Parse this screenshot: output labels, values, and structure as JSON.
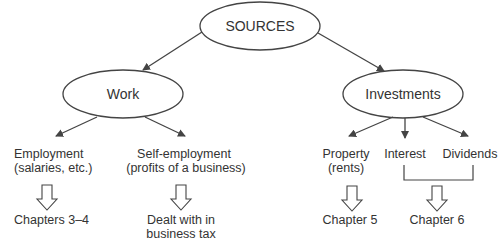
{
  "diagram": {
    "colors": {
      "stroke": "#444444",
      "text": "#333333",
      "background": "#ffffff"
    },
    "root": {
      "label": "SOURCES"
    },
    "categories": [
      {
        "id": "work",
        "label": "Work"
      },
      {
        "id": "investments",
        "label": "Investments"
      }
    ],
    "leaves": {
      "employment": {
        "line1": "Employment",
        "line2": "(salaries, etc.)"
      },
      "self_employment": {
        "line1": "Self-employment",
        "line2": "(profits of a business)"
      },
      "property": {
        "line1": "Property",
        "line2": "(rents)"
      },
      "interest": {
        "line1": "Interest"
      },
      "dividends": {
        "line1": "Dividends"
      }
    },
    "outcomes": {
      "employment": {
        "line1": "Chapters 3–4"
      },
      "self_employment": {
        "line1": "Dealt with in",
        "line2": "business tax"
      },
      "property": {
        "line1": "Chapter 5"
      },
      "interest_dividends": {
        "line1": "Chapter 6"
      }
    },
    "edges": [
      {
        "from": "SOURCES",
        "to": "Work"
      },
      {
        "from": "SOURCES",
        "to": "Investments"
      },
      {
        "from": "Work",
        "to": "Employment"
      },
      {
        "from": "Work",
        "to": "Self-employment"
      },
      {
        "from": "Investments",
        "to": "Property"
      },
      {
        "from": "Investments",
        "to": "Interest"
      },
      {
        "from": "Investments",
        "to": "Dividends"
      },
      {
        "from": "Employment",
        "to": "Chapters 3–4"
      },
      {
        "from": "Self-employment",
        "to": "Dealt with in business tax"
      },
      {
        "from": "Property",
        "to": "Chapter 5"
      },
      {
        "from": "Interest + Dividends",
        "to": "Chapter 6"
      }
    ]
  }
}
